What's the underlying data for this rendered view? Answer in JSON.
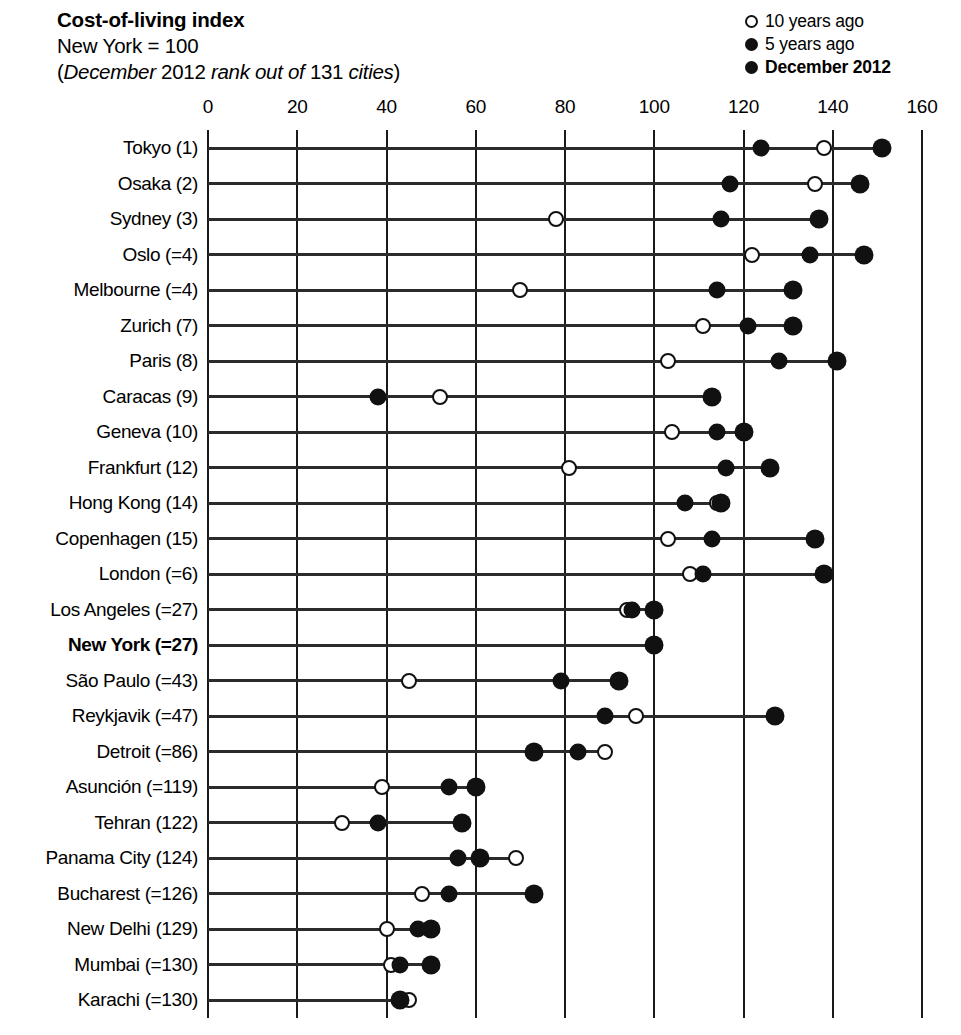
{
  "header": {
    "title": "Cost-of-living index",
    "subtitle_1": "New York = 100",
    "subtitle_2_pre": "(",
    "subtitle_2_i1": "December",
    "subtitle_2_n1": " 2012 ",
    "subtitle_2_i2": "rank out of",
    "subtitle_2_n2": " 131 ",
    "subtitle_2_i3": "cities",
    "subtitle_2_post": ")",
    "subtitle_2_full": "(December 2012 rank out of 131 cities)"
  },
  "legend": [
    {
      "marker": "open-circle-icon",
      "label": "10 years ago",
      "bold": false
    },
    {
      "marker": "filled-circle-icon",
      "label": "5 years ago",
      "bold": false
    },
    {
      "marker": "filled-circle-icon",
      "label": "December 2012",
      "bold": true
    }
  ],
  "chart_data": {
    "type": "scatter",
    "title": "Cost-of-living index",
    "subtitle": "New York = 100 (December 2012 rank out of 131 cities)",
    "xlabel": "",
    "ylabel": "",
    "xlim": [
      0,
      160
    ],
    "xticks": [
      0,
      20,
      40,
      60,
      80,
      100,
      120,
      140,
      160
    ],
    "ticklabels": [
      "0",
      "20",
      "40",
      "60",
      "80",
      "100",
      "120",
      "140",
      "160"
    ],
    "grid": "vertical",
    "legend_position": "top-right",
    "series": [
      {
        "name": "10 years ago",
        "marker": "open-circle"
      },
      {
        "name": "5 years ago",
        "marker": "filled-circle"
      },
      {
        "name": "December 2012",
        "marker": "filled-circle-large"
      }
    ],
    "categories": [
      "Tokyo (1)",
      "Osaka (2)",
      "Sydney (3)",
      "Oslo (=4)",
      "Melbourne (=4)",
      "Zurich (7)",
      "Paris (8)",
      "Caracas (9)",
      "Geneva (10)",
      "Frankfurt (12)",
      "Hong Kong (14)",
      "Copenhagen (15)",
      "London (=6)",
      "Los Angeles (=27)",
      "New York (=27)",
      "São Paulo (=43)",
      "Reykjavik (=47)",
      "Detroit (=86)",
      "Asunción (=119)",
      "Tehran (122)",
      "Panama City (124)",
      "Bucharest (=126)",
      "New Delhi (129)",
      "Mumbai (=130)",
      "Karachi (=130)"
    ],
    "rows": [
      {
        "label": "Tokyo (1)",
        "highlight": false,
        "ten_years_ago": 138,
        "five_years_ago": 124,
        "december_2012": 151
      },
      {
        "label": "Osaka (2)",
        "highlight": false,
        "ten_years_ago": 136,
        "five_years_ago": 117,
        "december_2012": 146
      },
      {
        "label": "Sydney (3)",
        "highlight": false,
        "ten_years_ago": 78,
        "five_years_ago": 115,
        "december_2012": 137
      },
      {
        "label": "Oslo (=4)",
        "highlight": false,
        "ten_years_ago": 122,
        "five_years_ago": 135,
        "december_2012": 147
      },
      {
        "label": "Melbourne (=4)",
        "highlight": false,
        "ten_years_ago": 70,
        "five_years_ago": 114,
        "december_2012": 131
      },
      {
        "label": "Zurich (7)",
        "highlight": false,
        "ten_years_ago": 111,
        "five_years_ago": 121,
        "december_2012": 131
      },
      {
        "label": "Paris (8)",
        "highlight": false,
        "ten_years_ago": 103,
        "five_years_ago": 128,
        "december_2012": 141
      },
      {
        "label": "Caracas (9)",
        "highlight": false,
        "ten_years_ago": 52,
        "five_years_ago": 38,
        "december_2012": 113
      },
      {
        "label": "Geneva (10)",
        "highlight": false,
        "ten_years_ago": 104,
        "five_years_ago": 114,
        "december_2012": 120
      },
      {
        "label": "Frankfurt (12)",
        "highlight": false,
        "ten_years_ago": 81,
        "five_years_ago": 116,
        "december_2012": 126
      },
      {
        "label": "Hong Kong (14)",
        "highlight": false,
        "ten_years_ago": 114,
        "five_years_ago": 107,
        "december_2012": 115
      },
      {
        "label": "Copenhagen (15)",
        "highlight": false,
        "ten_years_ago": 103,
        "five_years_ago": 113,
        "december_2012": 136
      },
      {
        "label": "London (=6)",
        "highlight": false,
        "ten_years_ago": 108,
        "five_years_ago": 111,
        "december_2012": 138
      },
      {
        "label": "Los Angeles (=27)",
        "highlight": false,
        "ten_years_ago": 94,
        "five_years_ago": 95,
        "december_2012": 100
      },
      {
        "label": "New York (=27)",
        "highlight": true,
        "ten_years_ago": 100,
        "five_years_ago": 100,
        "december_2012": 100
      },
      {
        "label": "São Paulo (=43)",
        "highlight": false,
        "ten_years_ago": 45,
        "five_years_ago": 79,
        "december_2012": 92
      },
      {
        "label": "Reykjavik (=47)",
        "highlight": false,
        "ten_years_ago": 96,
        "five_years_ago": 89,
        "december_2012": 127
      },
      {
        "label": "Detroit (=86)",
        "highlight": false,
        "ten_years_ago": 89,
        "five_years_ago": 83,
        "december_2012": 73
      },
      {
        "label": "Asunción (=119)",
        "highlight": false,
        "ten_years_ago": 39,
        "five_years_ago": 54,
        "december_2012": 60
      },
      {
        "label": "Tehran (122)",
        "highlight": false,
        "ten_years_ago": 30,
        "five_years_ago": 38,
        "december_2012": 57
      },
      {
        "label": "Panama City (124)",
        "highlight": false,
        "ten_years_ago": 69,
        "five_years_ago": 56,
        "december_2012": 61
      },
      {
        "label": "Bucharest (=126)",
        "highlight": false,
        "ten_years_ago": 48,
        "five_years_ago": 54,
        "december_2012": 73
      },
      {
        "label": "New Delhi (129)",
        "highlight": false,
        "ten_years_ago": 40,
        "five_years_ago": 47,
        "december_2012": 50
      },
      {
        "label": "Mumbai (=130)",
        "highlight": false,
        "ten_years_ago": 41,
        "five_years_ago": 43,
        "december_2012": 50
      },
      {
        "label": "Karachi (=130)",
        "highlight": false,
        "ten_years_ago": 45,
        "five_years_ago": 43,
        "december_2012": 43
      }
    ]
  }
}
